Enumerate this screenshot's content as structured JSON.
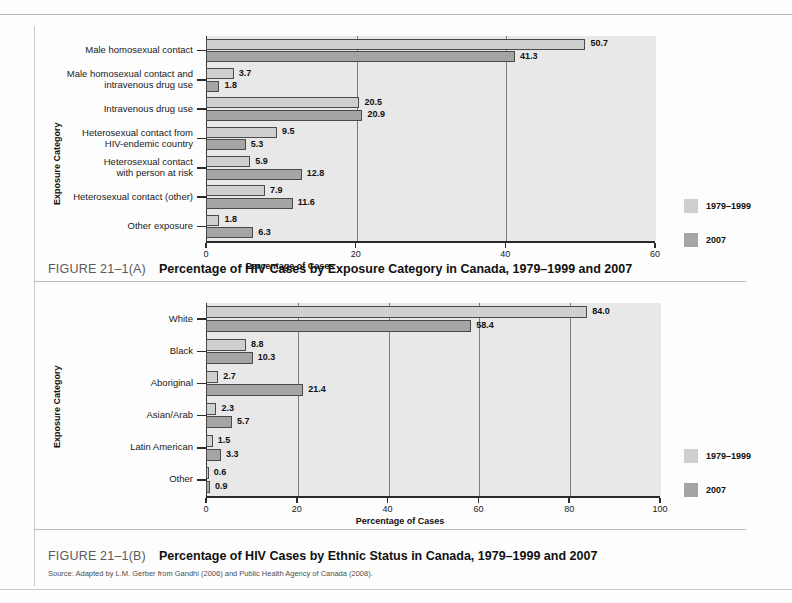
{
  "chart_data": [
    {
      "type": "bar",
      "orientation": "horizontal",
      "id": "figure-a",
      "figure_number": "FIGURE 21–1(A)",
      "title": "Percentage of HIV Cases by Exposure Category in Canada, 1979–1999 and 2007",
      "xlabel": "Percentage of Cases",
      "ylabel": "Exposure Category",
      "xlim": [
        0,
        60
      ],
      "xticks": [
        0,
        20,
        40,
        60
      ],
      "xticklabels": [
        "0",
        "20",
        "40",
        "60"
      ],
      "grid": true,
      "legend_position": "right",
      "categories": [
        "Male homosexual contact",
        "Male homosexual contact and\nintravenous drug use",
        "Intravenous drug use",
        "Heterosexual contact from\nHIV-endemic country",
        "Heterosexual contact\nwith person at risk",
        "Heterosexual contact (other)",
        "Other exposure"
      ],
      "series": [
        {
          "name": "1979–1999",
          "color": "#cfcfcf",
          "values": [
            50.7,
            3.7,
            20.5,
            9.5,
            5.9,
            7.9,
            1.8
          ]
        },
        {
          "name": "2007",
          "color": "#a5a5a5",
          "values": [
            41.3,
            1.8,
            20.9,
            5.3,
            12.8,
            11.6,
            6.3
          ]
        }
      ],
      "value_labels": [
        [
          "50.7",
          "3.7",
          "20.5",
          "9.5",
          "5.9",
          "7.9",
          "1.8"
        ],
        [
          "41.3",
          "1.8",
          "20.9",
          "5.3",
          "12.8",
          "11.6",
          "6.3"
        ]
      ]
    },
    {
      "type": "bar",
      "orientation": "horizontal",
      "id": "figure-b",
      "figure_number": "FIGURE 21–1(B)",
      "title": "Percentage of HIV Cases by Ethnic Status in Canada, 1979–1999 and 2007",
      "xlabel": "Percentage of Cases",
      "ylabel": "Exposure Category",
      "xlim": [
        0,
        100
      ],
      "xticks": [
        0,
        20,
        40,
        60,
        80,
        100
      ],
      "xticklabels": [
        "0",
        "20",
        "40",
        "60",
        "80",
        "100"
      ],
      "grid": true,
      "legend_position": "right",
      "categories": [
        "White",
        "Black",
        "Aboriginal",
        "Asian/Arab",
        "Latin American",
        "Other"
      ],
      "series": [
        {
          "name": "1979–1999",
          "color": "#cfcfcf",
          "values": [
            84.0,
            8.8,
            2.7,
            2.3,
            1.5,
            0.6
          ]
        },
        {
          "name": "2007",
          "color": "#a5a5a5",
          "values": [
            58.4,
            10.3,
            21.4,
            5.7,
            3.3,
            0.9
          ]
        }
      ],
      "value_labels": [
        [
          "84.0",
          "8.8",
          "2.7",
          "2.3",
          "1.5",
          "0.6"
        ],
        [
          "58.4",
          "10.3",
          "21.4",
          "5.7",
          "3.3",
          "0.9"
        ]
      ]
    }
  ],
  "source_note": "Source: Adapted by L.M. Gerber from Gandhi (2006) and Public Health Agency of Canada (2008)."
}
